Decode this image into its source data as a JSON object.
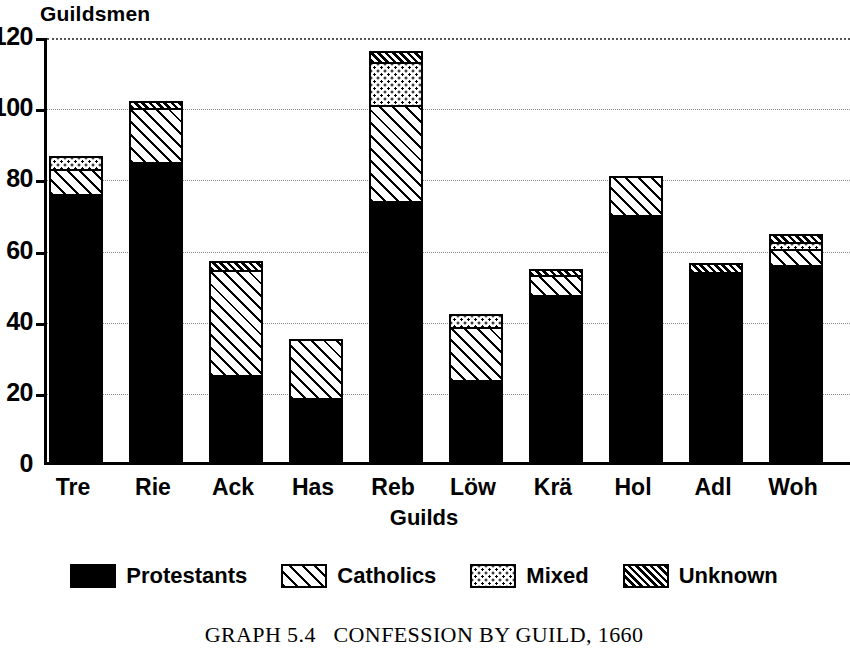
{
  "axis": {
    "y_title": "Guildsmen",
    "x_title": "Guilds",
    "y_ticks": [
      "0",
      "20",
      "40",
      "60",
      "80",
      "100",
      "120"
    ]
  },
  "legend": {
    "items": [
      {
        "label": "Protestants",
        "swatch": "solid-black-swatch"
      },
      {
        "label": "Catholics",
        "swatch": "diagonal-hatch-swatch"
      },
      {
        "label": "Mixed",
        "swatch": "dotted-swatch"
      },
      {
        "label": "Unknown",
        "swatch": "dense-hatch-swatch"
      }
    ]
  },
  "caption": "GRAPH 5.4   CONFESSION BY GUILD, 1660",
  "chart_data": {
    "type": "bar",
    "subtype": "stacked",
    "title": "GRAPH 5.4   CONFESSION BY GUILD, 1660",
    "xlabel": "Guilds",
    "ylabel": "Guildsmen",
    "ylim": [
      0,
      120
    ],
    "yticks": [
      0,
      20,
      40,
      60,
      80,
      100,
      120
    ],
    "grid": true,
    "legend_position": "bottom",
    "categories": [
      "Tre",
      "Rie",
      "Ack",
      "Has",
      "Reb",
      "Löw",
      "Krä",
      "Hol",
      "Adl",
      "Woh"
    ],
    "series": [
      {
        "name": "Protestants",
        "values": [
          76,
          85,
          25,
          18.5,
          74,
          23.5,
          47.5,
          70,
          54,
          56
        ]
      },
      {
        "name": "Catholics",
        "values": [
          7,
          15,
          29.5,
          16,
          27,
          15,
          5.5,
          10.5,
          0,
          4.5
        ]
      },
      {
        "name": "Mixed",
        "values": [
          3,
          0,
          0,
          0,
          12,
          3,
          0,
          0,
          0,
          2
        ]
      },
      {
        "name": "Unknown",
        "values": [
          0,
          1.5,
          2,
          0,
          2.5,
          0,
          1.2,
          0,
          2,
          1.5
        ]
      }
    ],
    "totals": [
      86,
      101.5,
      56.5,
      34.5,
      115.5,
      41.5,
      54.2,
      80.5,
      56,
      64
    ]
  }
}
